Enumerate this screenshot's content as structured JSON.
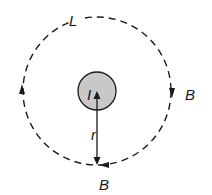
{
  "diagram": {
    "loop_label": "L",
    "current_label": "I",
    "radius_label": "r",
    "field_label_right": "B",
    "field_label_bottom": "B",
    "colors": {
      "stroke": "#1a1a1a",
      "wire_fill": "#c8c8c8",
      "background": "#ffffff"
    }
  }
}
